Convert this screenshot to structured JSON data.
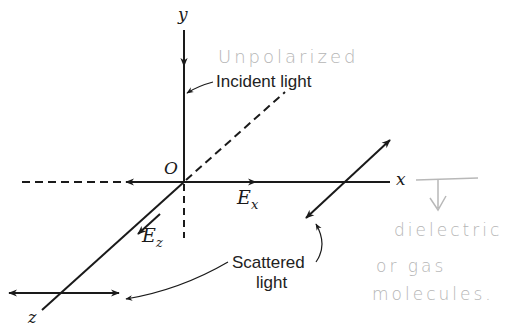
{
  "figure": {
    "type": "physics diagram: light scattering geometry",
    "axes": {
      "x_label": "x",
      "y_label": "y",
      "z_label": "z",
      "origin_label": "O"
    },
    "field_labels": {
      "ex_main": "E",
      "ex_sub": "x",
      "ez_main": "E",
      "ez_sub": "z"
    },
    "printed_labels": {
      "incident": "Incident light",
      "scattered_line1": "Scattered",
      "scattered_line2": "light"
    },
    "handwritten_annotations": {
      "top": "Unpolarized",
      "right_line1": "dielectric",
      "right_line2": "or gas",
      "right_line3": "molecules."
    },
    "colors": {
      "ink": "#1a1a1a",
      "pencil": "#b5b5b5",
      "background": "#ffffff"
    }
  }
}
